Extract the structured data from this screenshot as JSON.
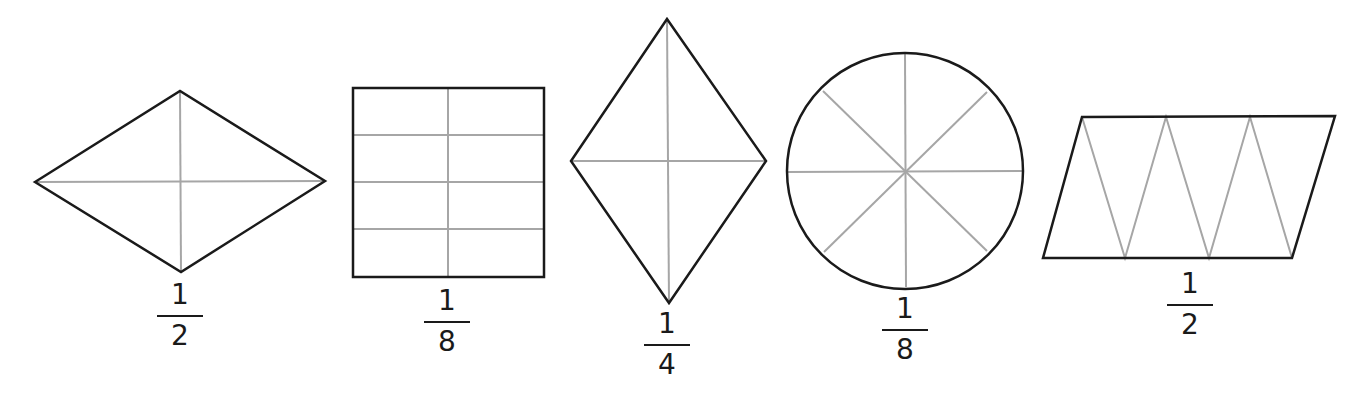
{
  "figures": [
    {
      "shape": "rhombus-horizontal",
      "parts": 4,
      "divisions": "two diagonals",
      "fraction": {
        "numerator": "1",
        "denominator": "2"
      }
    },
    {
      "shape": "rectangle",
      "parts": 8,
      "divisions": "1 vertical line, 3 horizontal lines",
      "fraction": {
        "numerator": "1",
        "denominator": "8"
      }
    },
    {
      "shape": "rhombus-vertical",
      "parts": 4,
      "divisions": "two diagonals",
      "fraction": {
        "numerator": "1",
        "denominator": "4"
      }
    },
    {
      "shape": "circle",
      "parts": 8,
      "divisions": "4 diameters",
      "fraction": {
        "numerator": "1",
        "denominator": "8"
      }
    },
    {
      "shape": "parallelogram",
      "parts": 6,
      "divisions": "zigzag into 6 triangles",
      "fraction": {
        "numerator": "1",
        "denominator": "2"
      }
    }
  ],
  "colors": {
    "outline": "#1a1a1a",
    "divider": "#a6a6a6",
    "background": "#ffffff"
  }
}
